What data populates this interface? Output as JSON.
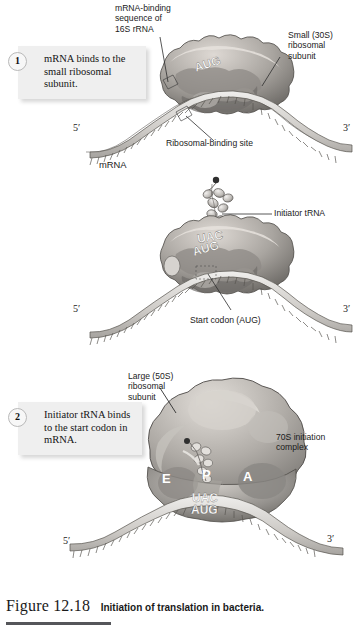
{
  "figure": {
    "number": "Figure 12.18",
    "caption": "Initiation of translation in bacteria."
  },
  "steps": [
    {
      "number": "1",
      "text": "mRNA binds to the small ribosomal subunit."
    },
    {
      "number": "2",
      "text": "Initiator tRNA binds to the start codon in mRNA."
    },
    {
      "number": "3",
      "text": "Large ribosomal subunit binds."
    }
  ],
  "panel1": {
    "label_mrna_binding_sequence": "mRNA-binding\nsequence of\n16S rRNA",
    "label_small_subunit": "Small (30S)\nribosomal\nsubunit",
    "label_ribosomal_binding_site": "Ribosomal-binding site",
    "label_mrna": "mRNA",
    "codon": "AUG",
    "five_prime": "5′",
    "three_prime": "3′"
  },
  "panel2": {
    "label_initiator_trna": "Initiator tRNA",
    "label_start_codon": "Start codon (AUG)",
    "anticodon": "UAC",
    "codon": "AUG",
    "five_prime": "5′",
    "three_prime": "3′"
  },
  "panel3": {
    "label_large_subunit": "Large (50S)\nribosomal\nsubunit",
    "label_70s_complex": "70S initiation\ncomplex",
    "site_e": "E",
    "site_p": "P",
    "site_a": "A",
    "anticodon": "UAC",
    "codon": "AUG",
    "five_prime": "5′",
    "three_prime": "3′"
  },
  "colors": {
    "box_background": "#efefef",
    "subunit_light": "#c9c6c2",
    "subunit_mid": "#9b9894",
    "subunit_dark": "#6f6c69",
    "mrna_light": "#d8d6d3",
    "outline": "#3a3a3a"
  }
}
